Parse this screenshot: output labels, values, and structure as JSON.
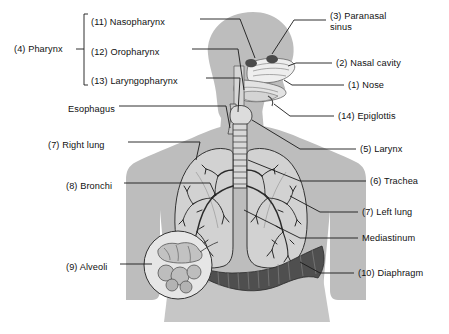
{
  "figure": {
    "background_color": "#ffffff",
    "body_fill": "#b9b9b9",
    "organ_fill": "#cfcfcf",
    "line_color": "#1a1a1a",
    "text_color": "#111111"
  },
  "labels_left": [
    {
      "id": "pharynx",
      "text": "(4) Pharynx",
      "x": 14,
      "y": 48
    },
    {
      "id": "nasopharynx",
      "text": "(11) Nasopharynx",
      "x": 91,
      "y": 22
    },
    {
      "id": "oropharynx",
      "text": "(12) Oropharynx",
      "x": 91,
      "y": 52
    },
    {
      "id": "laryngopharynx",
      "text": "(13) Laryngopharynx",
      "x": 91,
      "y": 81
    },
    {
      "id": "esophagus",
      "text": "Esophagus",
      "x": 68,
      "y": 109
    },
    {
      "id": "right-lung",
      "text": "(7) Right lung",
      "x": 48,
      "y": 145
    },
    {
      "id": "bronchi",
      "text": "(8) Bronchi",
      "x": 66,
      "y": 186
    },
    {
      "id": "alveoli",
      "text": "(9) Alveoli",
      "x": 66,
      "y": 267
    }
  ],
  "labels_right": [
    {
      "id": "paranasal-sinus",
      "text": "(3) Paranasal\nsinus",
      "x": 330,
      "y": 11,
      "wrap": true
    },
    {
      "id": "nasal-cavity",
      "text": "(2) Nasal cavity",
      "x": 336,
      "y": 60
    },
    {
      "id": "nose",
      "text": "(1) Nose",
      "x": 348,
      "y": 82
    },
    {
      "id": "epiglottis",
      "text": "(14) Epiglottis",
      "x": 338,
      "y": 113
    },
    {
      "id": "larynx",
      "text": "(5) Larynx",
      "x": 360,
      "y": 146
    },
    {
      "id": "trachea",
      "text": "(6) Trachea",
      "x": 370,
      "y": 178
    },
    {
      "id": "left-lung",
      "text": "(7) Left lung",
      "x": 362,
      "y": 209
    },
    {
      "id": "mediastinum",
      "text": "Mediastinum",
      "x": 362,
      "y": 235
    },
    {
      "id": "diaphragm",
      "text": "(10) Diaphragm",
      "x": 358,
      "y": 270
    }
  ],
  "bracket": {
    "id": "pharynx-bracket",
    "description": "Brace grouping nasopharynx, oropharynx and laryngopharynx under (4) Pharynx"
  }
}
